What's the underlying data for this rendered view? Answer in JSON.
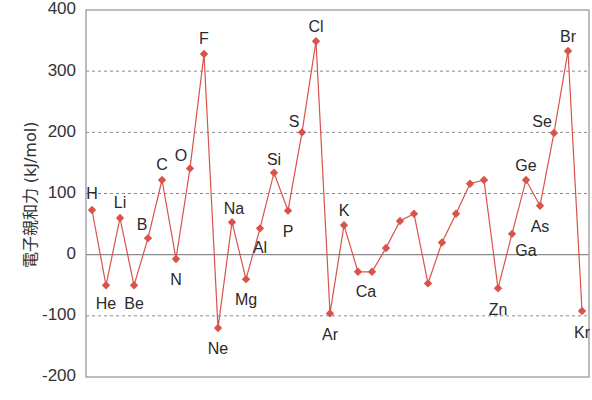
{
  "chart_data": {
    "type": "line",
    "title": "",
    "xlabel": "",
    "ylabel": "電子親和力 (kJ/mol)",
    "ylim": [
      -200,
      400
    ],
    "yticks": [
      400,
      300,
      200,
      100,
      0,
      -100,
      -200
    ],
    "grid": {
      "y": true,
      "style": "dashed",
      "zero_line": "solid"
    },
    "legend": null,
    "colors": {
      "series": "#d9534a",
      "axis": "#999999",
      "grid": "#8a8a8a",
      "text": "#333333"
    },
    "categories": [
      "H",
      "He",
      "Li",
      "Be",
      "B",
      "C",
      "N",
      "O",
      "F",
      "Ne",
      "Na",
      "Mg",
      "Al",
      "Si",
      "P",
      "S",
      "Cl",
      "Ar",
      "K",
      "Ca",
      "Sc",
      "Ti",
      "V",
      "Cr",
      "Mn",
      "Fe",
      "Co",
      "Ni",
      "Cu",
      "Zn",
      "Ga",
      "Ge",
      "As",
      "Se",
      "Br",
      "Kr"
    ],
    "series": [
      {
        "name": "電子親和力",
        "values": [
          73,
          -50,
          60,
          -50,
          27,
          122,
          -7,
          141,
          328,
          -120,
          53,
          -40,
          43,
          134,
          72,
          200,
          349,
          -96,
          48,
          -28,
          -28,
          11,
          55,
          67,
          -47,
          20,
          67,
          116,
          122,
          -55,
          34,
          122,
          80,
          199,
          333,
          -92
        ]
      }
    ],
    "point_labels": {
      "H": {
        "dx": 0,
        "dy": -15,
        "anchor": "middle"
      },
      "He": {
        "dx": 0,
        "dy": 20,
        "anchor": "middle"
      },
      "Li": {
        "dx": 0,
        "dy": -14,
        "anchor": "middle"
      },
      "Be": {
        "dx": 0,
        "dy": 20,
        "anchor": "middle"
      },
      "B": {
        "dx": -6,
        "dy": -12,
        "anchor": "middle"
      },
      "C": {
        "dx": 0,
        "dy": -14,
        "anchor": "middle"
      },
      "N": {
        "dx": 0,
        "dy": 22,
        "anchor": "middle"
      },
      "O": {
        "dx": -9,
        "dy": -12,
        "anchor": "middle"
      },
      "F": {
        "dx": 0,
        "dy": -14,
        "anchor": "middle"
      },
      "Ne": {
        "dx": 0,
        "dy": 22,
        "anchor": "middle"
      },
      "Na": {
        "dx": 2,
        "dy": -12,
        "anchor": "middle"
      },
      "Mg": {
        "dx": 0,
        "dy": 22,
        "anchor": "middle"
      },
      "Al": {
        "dx": 0,
        "dy": 20,
        "anchor": "middle"
      },
      "Si": {
        "dx": 0,
        "dy": -12,
        "anchor": "middle"
      },
      "P": {
        "dx": 0,
        "dy": 22,
        "anchor": "middle"
      },
      "S": {
        "dx": -8,
        "dy": -10,
        "anchor": "middle"
      },
      "Cl": {
        "dx": 0,
        "dy": -13,
        "anchor": "middle"
      },
      "Ar": {
        "dx": 0,
        "dy": 22,
        "anchor": "middle"
      },
      "K": {
        "dx": 0,
        "dy": -14,
        "anchor": "middle"
      },
      "Ca": {
        "dx": 8,
        "dy": 21,
        "anchor": "middle"
      },
      "Zn": {
        "dx": 0,
        "dy": 22,
        "anchor": "middle"
      },
      "Ga": {
        "dx": 14,
        "dy": 18,
        "anchor": "middle"
      },
      "Ge": {
        "dx": 0,
        "dy": -13,
        "anchor": "middle"
      },
      "As": {
        "dx": 0,
        "dy": 22,
        "anchor": "middle"
      },
      "Se": {
        "dx": -12,
        "dy": -10,
        "anchor": "middle"
      },
      "Br": {
        "dx": 0,
        "dy": -13,
        "anchor": "middle"
      },
      "Kr": {
        "dx": 0,
        "dy": 23,
        "anchor": "middle"
      }
    }
  }
}
